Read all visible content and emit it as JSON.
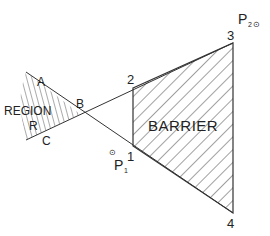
{
  "diagram": {
    "colors": {
      "stroke": "#333333",
      "hatch": "#444444",
      "text": "#222222",
      "background": "#ffffff"
    },
    "barrier": {
      "label": "BARRIER",
      "vertices": [
        {
          "id": "1",
          "x": 133,
          "y": 146
        },
        {
          "id": "2",
          "x": 133,
          "y": 88
        },
        {
          "id": "3",
          "x": 233,
          "y": 43
        },
        {
          "id": "4",
          "x": 233,
          "y": 213
        }
      ]
    },
    "region": {
      "label": "REGION",
      "sublabel": "R",
      "points": {
        "A": "A",
        "B": "B",
        "C": "C"
      }
    },
    "vertex_labels": {
      "v1": "1",
      "v2": "2",
      "v3": "3",
      "v4": "4"
    },
    "points": {
      "p1": {
        "label": "P",
        "subscript": "1",
        "symbol": "⊙"
      },
      "p2": {
        "label": "P",
        "subscript": "2",
        "symbol": "⊙"
      }
    }
  }
}
